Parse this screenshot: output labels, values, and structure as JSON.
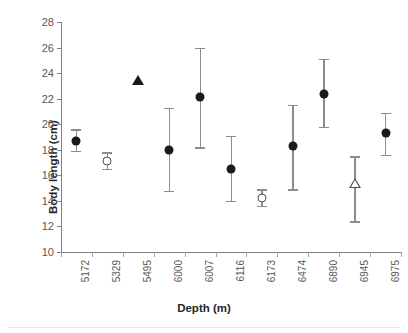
{
  "chart_data": {
    "type": "scatter",
    "title": "",
    "xlabel": "Depth (m)",
    "ylabel": "Body length (cm)",
    "categories": [
      "5172",
      "5329",
      "5495",
      "6000",
      "6007",
      "6116",
      "6173",
      "6474",
      "6890",
      "6945",
      "6975"
    ],
    "ylim": [
      10,
      28
    ],
    "yticks": [
      10,
      12,
      14,
      16,
      18,
      20,
      22,
      24,
      26,
      28
    ],
    "grid": false,
    "legend": "none",
    "marker_colors": {
      "filled": "#1a1a1a",
      "open_edge": "#4d4d4d",
      "open_fill": "#ffffff",
      "errorbar": "#8c8c8c"
    },
    "points": [
      {
        "category": "5172",
        "value": 18.7,
        "low": 17.9,
        "high": 19.6,
        "marker": "circle-filled"
      },
      {
        "category": "5329",
        "value": 17.1,
        "low": 16.5,
        "high": 17.8,
        "marker": "circle-open"
      },
      {
        "category": "5495",
        "value": 23.5,
        "low": null,
        "high": null,
        "marker": "triangle-filled"
      },
      {
        "category": "6000",
        "value": 18.0,
        "low": 14.8,
        "high": 21.3,
        "marker": "circle-filled"
      },
      {
        "category": "6007",
        "value": 22.1,
        "low": 18.2,
        "high": 26.0,
        "marker": "circle-filled"
      },
      {
        "category": "6116",
        "value": 16.5,
        "low": 14.0,
        "high": 19.1,
        "marker": "circle-filled"
      },
      {
        "category": "6173",
        "value": 14.2,
        "low": 13.6,
        "high": 14.9,
        "marker": "circle-open"
      },
      {
        "category": "6474",
        "value": 18.3,
        "low": 14.9,
        "high": 21.5,
        "marker": "circle-filled"
      },
      {
        "category": "6890",
        "value": 22.4,
        "low": 19.8,
        "high": 25.1,
        "marker": "circle-filled"
      },
      {
        "category": "6945",
        "value": 15.4,
        "low": 12.4,
        "high": 17.5,
        "marker": "triangle-open"
      },
      {
        "category": "6975",
        "value": 19.3,
        "low": 17.6,
        "high": 20.9,
        "marker": "circle-filled"
      }
    ]
  }
}
